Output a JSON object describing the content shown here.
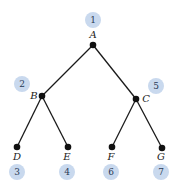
{
  "diagram": {
    "type": "binary-tree",
    "colors": {
      "badge": "#c9d9ee",
      "edge": "#1a1a1a",
      "node": "#111111"
    },
    "nodes": [
      {
        "id": "A",
        "label": "A",
        "x": 93,
        "y": 45,
        "label_x": 93,
        "label_y": 38,
        "anchor": "middle",
        "order": "1",
        "badge_x": 93,
        "badge_y": 20
      },
      {
        "id": "B",
        "label": "B",
        "x": 42,
        "y": 96,
        "label_x": 34,
        "label_y": 99,
        "anchor": "middle",
        "order": "2",
        "badge_x": 22,
        "badge_y": 84
      },
      {
        "id": "D",
        "label": "D",
        "x": 17,
        "y": 147,
        "label_x": 17,
        "label_y": 160,
        "anchor": "middle",
        "order": "3",
        "badge_x": 17,
        "badge_y": 172
      },
      {
        "id": "E",
        "label": "E",
        "x": 68,
        "y": 147,
        "label_x": 67,
        "label_y": 160,
        "anchor": "middle",
        "order": "4",
        "badge_x": 67,
        "badge_y": 172
      },
      {
        "id": "C",
        "label": "C",
        "x": 136,
        "y": 99,
        "label_x": 146,
        "label_y": 102,
        "anchor": "middle",
        "order": "5",
        "badge_x": 156,
        "badge_y": 86
      },
      {
        "id": "F",
        "label": "F",
        "x": 112,
        "y": 147,
        "label_x": 111,
        "label_y": 160,
        "anchor": "middle",
        "order": "6",
        "badge_x": 111,
        "badge_y": 172
      },
      {
        "id": "G",
        "label": "G",
        "x": 162,
        "y": 148,
        "label_x": 161,
        "label_y": 160,
        "anchor": "middle",
        "order": "7",
        "badge_x": 161,
        "badge_y": 172
      }
    ],
    "edges": [
      {
        "from": "A",
        "to": "B"
      },
      {
        "from": "A",
        "to": "C"
      },
      {
        "from": "B",
        "to": "D"
      },
      {
        "from": "B",
        "to": "E"
      },
      {
        "from": "C",
        "to": "F"
      },
      {
        "from": "C",
        "to": "G"
      }
    ]
  }
}
